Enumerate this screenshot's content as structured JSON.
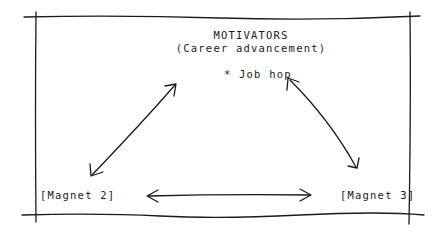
{
  "diagram": {
    "title": "MOTIVATORS",
    "subtitle": "(Career advancement)",
    "top_item": "* Job hop",
    "left_node": "[Magnet 2]",
    "right_node": "[Magnet 3]",
    "edges": [
      {
        "from": "top_item",
        "to": "left_node",
        "type": "bidirectional-arrow"
      },
      {
        "from": "top_item",
        "to": "right_node",
        "type": "bidirectional-arrow"
      },
      {
        "from": "left_node",
        "to": "right_node",
        "type": "bidirectional-arrow"
      }
    ],
    "colors": {
      "ink": "#1a1a1a",
      "background": "#ffffff"
    }
  }
}
